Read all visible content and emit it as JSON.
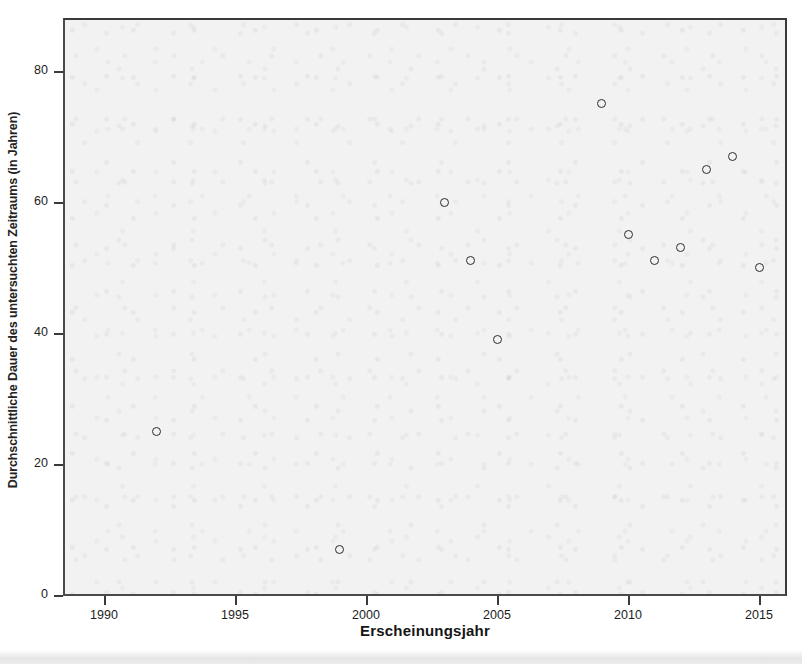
{
  "chart_data": {
    "type": "scatter",
    "title": "",
    "xlabel": "Erscheinungsjahr",
    "ylabel": "Durchschnittliche Dauer des untersuchten Zeitraums (in Jahren)",
    "xlim": [
      1988.8,
      2016.7
    ],
    "ylim": [
      0,
      88.3
    ],
    "xticks": [
      1990,
      1995,
      2000,
      2005,
      2010,
      2015
    ],
    "xtick_labels": [
      "1990",
      "1995",
      "2000",
      "2005",
      "2010",
      "2015"
    ],
    "yticks": [
      0,
      20,
      40,
      60,
      80
    ],
    "ytick_labels": [
      "0",
      "20",
      "40",
      "60",
      "80"
    ],
    "grid": false,
    "legend": null,
    "marker": {
      "shape": "open-circle",
      "edge_color": "#2b2b2b",
      "fill_color": "none",
      "size_px": 9
    },
    "plot_background": "#f2f2f2",
    "axis_color": "#3a3a3a",
    "points": [
      {
        "x": 1992,
        "y": 25
      },
      {
        "x": 1999,
        "y": 7
      },
      {
        "x": 2003,
        "y": 60
      },
      {
        "x": 2004,
        "y": 51
      },
      {
        "x": 2005,
        "y": 39
      },
      {
        "x": 2009,
        "y": 75
      },
      {
        "x": 2010,
        "y": 55
      },
      {
        "x": 2011,
        "y": 51
      },
      {
        "x": 2012,
        "y": 53
      },
      {
        "x": 2013,
        "y": 65
      },
      {
        "x": 2014,
        "y": 67
      },
      {
        "x": 2015,
        "y": 50
      }
    ],
    "series": [
      {
        "name": "Studien",
        "x": [
          1992,
          1999,
          2003,
          2004,
          2005,
          2009,
          2010,
          2011,
          2012,
          2013,
          2014,
          2015
        ],
        "values": [
          25,
          7,
          60,
          51,
          39,
          75,
          55,
          51,
          53,
          65,
          67,
          50
        ]
      }
    ]
  }
}
